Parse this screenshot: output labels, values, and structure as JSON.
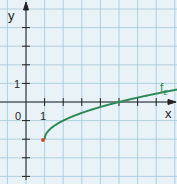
{
  "chart_data": {
    "type": "line",
    "title": "",
    "xlabel": "x",
    "ylabel": "y",
    "xlim": [
      -1,
      8.3
    ],
    "ylim": [
      -4,
      5
    ],
    "grid": true,
    "tick_labels": {
      "x": [
        "0",
        "1"
      ],
      "y": [
        "1"
      ]
    },
    "series": [
      {
        "name": "f2",
        "formula": "sqrt(x-1) - 2",
        "color": "#2e8b57",
        "x": [
          1,
          1.25,
          2,
          3,
          4,
          5,
          6,
          7,
          8,
          8.3
        ],
        "y": [
          -2,
          -1.5,
          -1,
          -0.59,
          -0.27,
          0,
          0.24,
          0.45,
          0.65,
          0.7
        ]
      }
    ],
    "annotations": [
      {
        "label": "f2",
        "x": 8,
        "y": 1
      }
    ],
    "start_point": {
      "x": 1,
      "y": -2,
      "color": "#d9443a"
    }
  },
  "labels": {
    "x_axis": "x",
    "y_axis": "y",
    "origin": "0",
    "x_one": "1",
    "y_one": "1",
    "curve": "f",
    "curve_sub": "2"
  }
}
